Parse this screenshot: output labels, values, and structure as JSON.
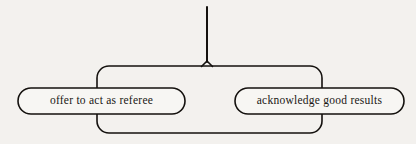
{
  "canvas": {
    "width": 416,
    "height": 144,
    "background_color": "#f3f1ee"
  },
  "style": {
    "stroke_color": "#14110e",
    "node_fill": "#f7f6f3",
    "text_color": "#1a1714",
    "stroke_width": 1.6,
    "trunk_stroke_width": 2.0
  },
  "diagram": {
    "type": "bracket-grouping",
    "trunk": {
      "name": "root-trunk",
      "x": 207,
      "y_top": 7,
      "y_bottom": 66
    },
    "group_frame": {
      "name": "sibling-group-frame",
      "x": 97,
      "y": 66,
      "width": 225,
      "height": 67,
      "corner_radius": 12
    },
    "nodes": [
      {
        "id": "node-offer-referee",
        "label": "offer to act as referee",
        "x": 18,
        "y": 88,
        "width": 167,
        "height": 26,
        "corner_radius": 13
      },
      {
        "id": "node-acknowledge-results",
        "label": "acknowledge good results",
        "x": 235,
        "y": 88,
        "width": 169,
        "height": 26,
        "corner_radius": 13
      }
    ]
  }
}
